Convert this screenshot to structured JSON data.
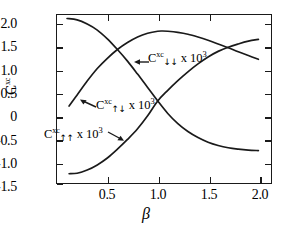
{
  "figure": {
    "background": "#ffffff",
    "curve_color": "#1a1a1a",
    "axis_color": "#1a1a1a"
  },
  "axes": {
    "xlabel": "β",
    "ylabel_base": "C",
    "ylabel_sup": "xc",
    "x_ticks": [
      "0.5",
      "1.0",
      "1.5",
      "2.0"
    ],
    "x_tick_values": [
      0.5,
      1.0,
      1.5,
      2.0
    ],
    "y_ticks": [
      "2.0",
      "1.5",
      "1.0",
      "0.5",
      "0",
      "-0.5",
      "-1.0",
      "-1.5"
    ],
    "y_tick_values": [
      2.0,
      1.5,
      1.0,
      0.5,
      0,
      -0.5,
      -1.0,
      -1.5
    ],
    "xlim": [
      0.0,
      2.125
    ],
    "ylim": [
      -1.5,
      2.125
    ]
  },
  "annotations": [
    {
      "id": "label-down-down",
      "base": "C",
      "sup": "xc",
      "sub": "↓↓",
      "mul": " x ",
      "factor": "10",
      "power": "3",
      "x": 148,
      "y": 56
    },
    {
      "id": "label-up-down",
      "base": "C",
      "sup": "xc",
      "sub": "↑↓",
      "mul": " x ",
      "factor": "10",
      "power": "3",
      "x": 96,
      "y": 103
    },
    {
      "id": "label-up-up",
      "base": "C",
      "sup": "xc",
      "sub": "↑↑",
      "mul": " x ",
      "factor": "10",
      "power": "3",
      "x": 44,
      "y": 132
    }
  ],
  "chart_data": {
    "type": "line",
    "title": "",
    "xlabel": "β",
    "ylabel": "C^xc",
    "xlim": [
      0.0,
      2.125
    ],
    "ylim": [
      -1.5,
      2.125
    ],
    "grid": false,
    "legend": "inline-annotations",
    "series": [
      {
        "name": "C_{↓↓}^{xc} x 10^3",
        "comment": "rises from ~0.15 at low beta, peaks ~1.78 near beta=1.05, slowly decreases",
        "x": [
          0.12,
          0.2,
          0.3,
          0.4,
          0.5,
          0.6,
          0.7,
          0.8,
          0.9,
          1.0,
          1.05,
          1.1,
          1.2,
          1.3,
          1.4,
          1.5,
          1.6,
          1.7,
          1.8,
          1.9,
          2.0
        ],
        "y": [
          0.16,
          0.4,
          0.7,
          0.97,
          1.19,
          1.38,
          1.53,
          1.65,
          1.73,
          1.775,
          1.78,
          1.775,
          1.75,
          1.71,
          1.65,
          1.58,
          1.5,
          1.42,
          1.33,
          1.25,
          1.17
        ]
      },
      {
        "name": "C_{↑↓}^{xc} x 10^3",
        "comment": "monotonically decreasing from ~2.05 at beta=0.1 to ~-0.8 at beta=2.0",
        "x": [
          0.1,
          0.2,
          0.3,
          0.4,
          0.5,
          0.6,
          0.7,
          0.8,
          0.9,
          1.0,
          1.1,
          1.2,
          1.3,
          1.4,
          1.5,
          1.6,
          1.7,
          1.8,
          1.9,
          2.0
        ],
        "y": [
          2.05,
          2.02,
          1.93,
          1.8,
          1.61,
          1.38,
          1.13,
          0.85,
          0.56,
          0.27,
          0.0,
          -0.22,
          -0.39,
          -0.52,
          -0.62,
          -0.69,
          -0.74,
          -0.77,
          -0.79,
          -0.8
        ]
      },
      {
        "name": "C_{↑↑}^{xc} x 10^3",
        "comment": "rises monotonically from ~-1.30 at low beta through 0.27 near beta=1.0 to ~1.60 at beta=2.0",
        "x": [
          0.12,
          0.2,
          0.3,
          0.4,
          0.5,
          0.6,
          0.7,
          0.8,
          0.9,
          1.0,
          1.1,
          1.2,
          1.3,
          1.4,
          1.5,
          1.6,
          1.7,
          1.8,
          1.9,
          2.0
        ],
        "y": [
          -1.3,
          -1.29,
          -1.22,
          -1.11,
          -0.96,
          -0.77,
          -0.56,
          -0.33,
          -0.05,
          0.27,
          0.5,
          0.71,
          0.9,
          1.07,
          1.22,
          1.34,
          1.43,
          1.5,
          1.56,
          1.6
        ]
      }
    ]
  }
}
